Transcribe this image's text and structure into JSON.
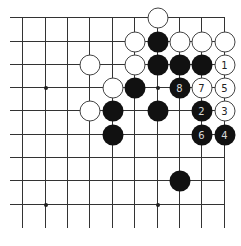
{
  "board": {
    "columns_x": [
      22,
      45,
      67,
      89,
      112,
      134,
      157,
      179,
      201,
      224
    ],
    "rows_y": [
      17,
      41,
      64,
      87,
      110,
      134,
      157,
      180,
      204
    ],
    "line_color": "#333333",
    "star_points": [
      [
        1,
        3
      ],
      [
        6,
        3
      ],
      [
        1,
        8
      ],
      [
        6,
        8
      ]
    ],
    "stones": [
      {
        "col": 6,
        "row": 0,
        "color": "white",
        "label": ""
      },
      {
        "col": 5,
        "row": 1,
        "color": "white",
        "label": ""
      },
      {
        "col": 6,
        "row": 1,
        "color": "black",
        "label": ""
      },
      {
        "col": 7,
        "row": 1,
        "color": "white",
        "label": ""
      },
      {
        "col": 8,
        "row": 1,
        "color": "white",
        "label": ""
      },
      {
        "col": 9,
        "row": 1,
        "color": "white",
        "label": ""
      },
      {
        "col": 3,
        "row": 2,
        "color": "white",
        "label": ""
      },
      {
        "col": 5,
        "row": 2,
        "color": "white",
        "label": ""
      },
      {
        "col": 6,
        "row": 2,
        "color": "black",
        "label": ""
      },
      {
        "col": 7,
        "row": 2,
        "color": "black",
        "label": ""
      },
      {
        "col": 8,
        "row": 2,
        "color": "black",
        "label": ""
      },
      {
        "col": 9,
        "row": 2,
        "color": "white",
        "label": "1"
      },
      {
        "col": 4,
        "row": 3,
        "color": "white",
        "label": ""
      },
      {
        "col": 5,
        "row": 3,
        "color": "black",
        "label": ""
      },
      {
        "col": 7,
        "row": 3,
        "color": "black",
        "label": "8"
      },
      {
        "col": 8,
        "row": 3,
        "color": "white",
        "label": "7"
      },
      {
        "col": 9,
        "row": 3,
        "color": "white",
        "label": "5"
      },
      {
        "col": 3,
        "row": 4,
        "color": "white",
        "label": ""
      },
      {
        "col": 4,
        "row": 4,
        "color": "black",
        "label": ""
      },
      {
        "col": 6,
        "row": 4,
        "color": "black",
        "label": ""
      },
      {
        "col": 8,
        "row": 4,
        "color": "black",
        "label": "2"
      },
      {
        "col": 9,
        "row": 4,
        "color": "white",
        "label": "3"
      },
      {
        "col": 4,
        "row": 5,
        "color": "black",
        "label": ""
      },
      {
        "col": 8,
        "row": 5,
        "color": "black",
        "label": "6"
      },
      {
        "col": 9,
        "row": 5,
        "color": "black",
        "label": "4"
      },
      {
        "col": 7,
        "row": 7,
        "color": "black",
        "label": ""
      }
    ]
  }
}
